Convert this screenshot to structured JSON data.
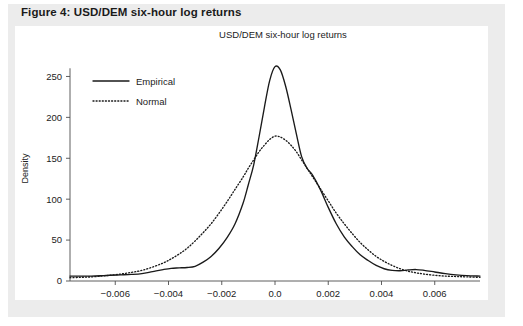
{
  "figure": {
    "caption": "Figure 4: USD/DEM six-hour log returns",
    "background_color": "#ececec",
    "panel_color": "#ffffff"
  },
  "chart_data": {
    "type": "line",
    "title": "USD/DEM six-hour log returns",
    "xlabel": "",
    "ylabel": "Density",
    "xlim": [
      -0.0077,
      0.0077
    ],
    "ylim": [
      0,
      275
    ],
    "grid": false,
    "legend_position": "upper left",
    "xticks": [
      -0.006,
      -0.004,
      -0.002,
      0.0,
      0.002,
      0.004,
      0.006
    ],
    "xtick_labels": [
      "-0.006",
      "-0.004",
      "-0.002",
      "0.0",
      "0.002",
      "0.004",
      "0.006"
    ],
    "yticks": [
      0,
      50,
      100,
      150,
      200,
      250
    ],
    "ytick_labels": [
      "0",
      "50",
      "100",
      "150",
      "200",
      "250"
    ],
    "series": [
      {
        "name": "Empirical",
        "style": "solid",
        "color": "#1a1a1a",
        "x": [
          -0.0077,
          -0.0073,
          -0.0069,
          -0.0065,
          -0.0062,
          -0.0058,
          -0.0054,
          -0.005,
          -0.0046,
          -0.0042,
          -0.0039,
          -0.0036,
          -0.0033,
          -0.003,
          -0.0027,
          -0.0024,
          -0.0021,
          -0.0018,
          -0.0015,
          -0.0012,
          -0.001,
          -0.0008,
          -0.0006,
          -0.0004,
          -0.0002,
          0.0,
          0.0002,
          0.0004,
          0.0006,
          0.0008,
          0.001,
          0.0012,
          0.0014,
          0.0017,
          0.002,
          0.0023,
          0.0026,
          0.0029,
          0.0032,
          0.0035,
          0.0038,
          0.0041,
          0.0044,
          0.0047,
          0.005,
          0.0053,
          0.0056,
          0.006,
          0.0064,
          0.0068,
          0.0072,
          0.0077
        ],
        "y": [
          6,
          6,
          6,
          6.5,
          7,
          7.5,
          8,
          9,
          11.5,
          14,
          15.5,
          16,
          16.5,
          18,
          23,
          30,
          40,
          53,
          70,
          95,
          118,
          142,
          176,
          212,
          245,
          262,
          258,
          238,
          210,
          180,
          152,
          138,
          130,
          112,
          90,
          70,
          54,
          42,
          32,
          25,
          19,
          15,
          13,
          12.5,
          13.5,
          14,
          13,
          11,
          9,
          7.5,
          6.5,
          6
        ]
      },
      {
        "name": "Normal",
        "style": "dotted",
        "color": "#1a1a1a",
        "x": [
          -0.0077,
          -0.0073,
          -0.0069,
          -0.0065,
          -0.0062,
          -0.0058,
          -0.0054,
          -0.005,
          -0.0046,
          -0.0042,
          -0.0039,
          -0.0036,
          -0.0033,
          -0.003,
          -0.0027,
          -0.0024,
          -0.0021,
          -0.0018,
          -0.0015,
          -0.0012,
          -0.001,
          -0.0008,
          -0.0006,
          -0.0004,
          -0.0002,
          0.0,
          0.0002,
          0.0004,
          0.0006,
          0.0008,
          0.001,
          0.0012,
          0.0014,
          0.0017,
          0.002,
          0.0023,
          0.0026,
          0.0029,
          0.0032,
          0.0035,
          0.0038,
          0.0041,
          0.0044,
          0.0047,
          0.005,
          0.0053,
          0.0056,
          0.006,
          0.0064,
          0.0068,
          0.0072,
          0.0077
        ],
        "y": [
          4,
          4.5,
          5,
          6,
          7,
          8.5,
          10.5,
          13,
          17,
          22,
          27,
          33,
          40,
          49,
          59,
          70,
          83,
          97,
          112,
          127,
          138,
          148,
          158,
          166,
          173,
          177,
          176,
          172,
          166,
          158,
          148,
          138,
          128,
          113,
          98,
          83,
          70,
          58,
          47,
          38,
          30,
          24,
          19,
          15,
          12,
          10,
          8.5,
          7,
          6,
          5.5,
          5,
          4.5
        ]
      }
    ]
  },
  "legend": {
    "items": [
      {
        "label": "Empirical",
        "style": "solid"
      },
      {
        "label": "Normal",
        "style": "dotted"
      }
    ]
  }
}
